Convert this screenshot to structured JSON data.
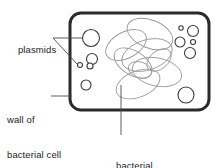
{
  "diagram": {
    "background_color": "#ffffff",
    "labels": {
      "plasmids": "plasmids",
      "wall_line1": "wall of",
      "wall_line2": "bacterial cell",
      "dna_line1": "bacterial",
      "dna_line2": "DNA"
    },
    "colors": {
      "cell_wall": "#2b2b2b",
      "plasmid_outline": "#3a3a3a",
      "dna_strand": "#9a9a9a",
      "leader_line": "#4a4a4a",
      "text": "#1d1d1d"
    },
    "cell_wall": {
      "x": 70,
      "y": 13,
      "width": 139,
      "height": 97,
      "corner_radius": 11,
      "stroke_width": 3
    },
    "plasmids": [
      {
        "cx": 91,
        "cy": 38,
        "r": 8.5
      },
      {
        "cx": 92,
        "cy": 59,
        "r": 5.5
      },
      {
        "cx": 80,
        "cy": 65,
        "r": 2.5
      },
      {
        "cx": 90,
        "cy": 66,
        "r": 3.0
      },
      {
        "cx": 86,
        "cy": 85,
        "r": 5.0
      },
      {
        "cx": 181,
        "cy": 28,
        "r": 2.2
      },
      {
        "cx": 193,
        "cy": 31,
        "r": 5.5
      },
      {
        "cx": 180,
        "cy": 42,
        "r": 5.0
      },
      {
        "cx": 193,
        "cy": 42,
        "r": 2.5
      },
      {
        "cx": 190,
        "cy": 53,
        "r": 5.5
      },
      {
        "cx": 186,
        "cy": 95,
        "r": 8.0
      }
    ],
    "dna_loops": [
      {
        "cx": 126,
        "cy": 45,
        "rx": 22,
        "ry": 13,
        "rotation": -28
      },
      {
        "cx": 150,
        "cy": 34,
        "rx": 24,
        "ry": 14,
        "rotation": 22
      },
      {
        "cx": 147,
        "cy": 55,
        "rx": 26,
        "ry": 15,
        "rotation": -18
      },
      {
        "cx": 133,
        "cy": 63,
        "rx": 21,
        "ry": 12,
        "rotation": 32
      },
      {
        "cx": 157,
        "cy": 72,
        "rx": 25,
        "ry": 14,
        "rotation": 12
      },
      {
        "cx": 138,
        "cy": 84,
        "rx": 23,
        "ry": 13,
        "rotation": -22
      },
      {
        "cx": 159,
        "cy": 60,
        "rx": 14,
        "ry": 9,
        "rotation": -40
      },
      {
        "cx": 140,
        "cy": 70,
        "rx": 12,
        "ry": 8,
        "rotation": 18
      }
    ],
    "leader_lines": [
      {
        "name": "plasmids-to-large-circle",
        "points": "53,38 82,38"
      },
      {
        "name": "plasmids-to-small-circles",
        "points": "53,38 77,64"
      },
      {
        "name": "wall-of-to-cell-wall",
        "points": "51,96 72,96"
      },
      {
        "name": "bacterial-dna-to-strand",
        "points": "121,135 121,85"
      }
    ]
  }
}
